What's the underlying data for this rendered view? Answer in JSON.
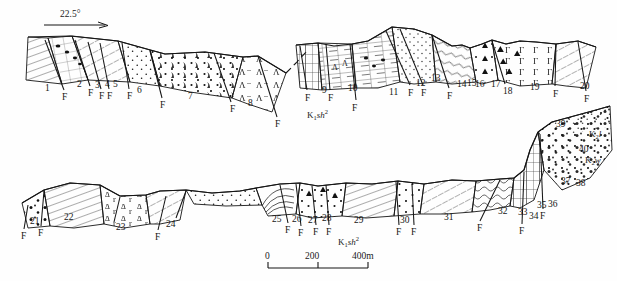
{
  "figure": {
    "type": "geological-cross-section",
    "background_color": "#fefefe",
    "ink_color": "#151515"
  },
  "dip_indicator": {
    "label": "22.5°",
    "name": "dip-angle-22-5"
  },
  "scale_bar": {
    "ticks": [
      "0",
      "200",
      "400m"
    ],
    "unit": "m"
  },
  "formation_labels": [
    {
      "id": "fm-upper",
      "text": "K1sh2",
      "base": "K",
      "sub": "1",
      "italic": "sh",
      "sup": "2"
    },
    {
      "id": "fm-lower",
      "text": "K1sh2",
      "base": "K",
      "sub": "1",
      "italic": "sh",
      "sup": "2"
    },
    {
      "id": "fm-k2l",
      "text": "K2l",
      "base": "K",
      "sub": "2",
      "italic": "l",
      "sup": ""
    },
    {
      "id": "fm-k2w",
      "text": "K2w",
      "base": "K",
      "sub": "2",
      "italic": "w",
      "sup": ""
    }
  ],
  "upper_panel": {
    "name": "upper-cross-section",
    "unit_numbers": [
      {
        "n": "1",
        "x": 45,
        "y": 84
      },
      {
        "n": "2",
        "x": 77,
        "y": 80
      },
      {
        "n": "3",
        "x": 95,
        "y": 81
      },
      {
        "n": "4",
        "x": 105,
        "y": 80
      },
      {
        "n": "5",
        "x": 113,
        "y": 80
      },
      {
        "n": "6",
        "x": 137,
        "y": 86
      },
      {
        "n": "7",
        "x": 188,
        "y": 92
      },
      {
        "n": "8",
        "x": 248,
        "y": 99
      },
      {
        "n": "9",
        "x": 322,
        "y": 86
      },
      {
        "n": "10",
        "x": 348,
        "y": 84
      },
      {
        "n": "11",
        "x": 389,
        "y": 88
      },
      {
        "n": "12",
        "x": 416,
        "y": 79
      },
      {
        "n": "13",
        "x": 431,
        "y": 74
      },
      {
        "n": "14",
        "x": 457,
        "y": 80
      },
      {
        "n": "15",
        "x": 467,
        "y": 79
      },
      {
        "n": "16",
        "x": 475,
        "y": 80
      },
      {
        "n": "17",
        "x": 491,
        "y": 80
      },
      {
        "n": "18",
        "x": 503,
        "y": 87
      },
      {
        "n": "19",
        "x": 530,
        "y": 83
      },
      {
        "n": "20",
        "x": 580,
        "y": 82
      }
    ],
    "fault_labels": [
      {
        "t": "F",
        "x": 62,
        "y": 93
      },
      {
        "t": "F",
        "x": 88,
        "y": 89
      },
      {
        "t": "F",
        "x": 99,
        "y": 92
      },
      {
        "t": "F",
        "x": 107,
        "y": 92
      },
      {
        "t": "F",
        "x": 127,
        "y": 92
      },
      {
        "t": "F",
        "x": 160,
        "y": 101
      },
      {
        "t": "F",
        "x": 230,
        "y": 105
      },
      {
        "t": "F",
        "x": 275,
        "y": 120
      },
      {
        "t": "F",
        "x": 305,
        "y": 94
      },
      {
        "t": "F",
        "x": 328,
        "y": 94
      },
      {
        "t": "F",
        "x": 352,
        "y": 104
      },
      {
        "t": "F",
        "x": 408,
        "y": 89
      },
      {
        "t": "F",
        "x": 421,
        "y": 89
      },
      {
        "t": "F",
        "x": 447,
        "y": 92
      },
      {
        "t": "F",
        "x": 553,
        "y": 90
      },
      {
        "t": "F",
        "x": 584,
        "y": 95
      }
    ]
  },
  "lower_panel": {
    "name": "lower-cross-section",
    "unit_numbers": [
      {
        "n": "21",
        "x": 30,
        "y": 217
      },
      {
        "n": "22",
        "x": 64,
        "y": 213
      },
      {
        "n": "23",
        "x": 116,
        "y": 223
      },
      {
        "n": "24",
        "x": 166,
        "y": 220
      },
      {
        "n": "25",
        "x": 272,
        "y": 215
      },
      {
        "n": "26",
        "x": 292,
        "y": 215
      },
      {
        "n": "27",
        "x": 308,
        "y": 216
      },
      {
        "n": "28",
        "x": 322,
        "y": 214
      },
      {
        "n": "29",
        "x": 354,
        "y": 216
      },
      {
        "n": "30",
        "x": 400,
        "y": 216
      },
      {
        "n": "31",
        "x": 444,
        "y": 213
      },
      {
        "n": "32",
        "x": 498,
        "y": 207
      },
      {
        "n": "33",
        "x": 518,
        "y": 208
      },
      {
        "n": "34",
        "x": 529,
        "y": 212
      },
      {
        "n": "35",
        "x": 537,
        "y": 201
      },
      {
        "n": "36",
        "x": 548,
        "y": 200
      },
      {
        "n": "37",
        "x": 561,
        "y": 177
      },
      {
        "n": "38",
        "x": 576,
        "y": 179
      },
      {
        "n": "39",
        "x": 556,
        "y": 120
      },
      {
        "n": "40",
        "x": 579,
        "y": 145
      }
    ],
    "fault_labels": [
      {
        "t": "F",
        "x": 21,
        "y": 232
      },
      {
        "t": "F",
        "x": 38,
        "y": 229
      },
      {
        "t": "F",
        "x": 155,
        "y": 233
      },
      {
        "t": "F",
        "x": 285,
        "y": 226
      },
      {
        "t": "F",
        "x": 298,
        "y": 229
      },
      {
        "t": "F",
        "x": 313,
        "y": 228
      },
      {
        "t": "F",
        "x": 326,
        "y": 228
      },
      {
        "t": "F",
        "x": 396,
        "y": 228
      },
      {
        "t": "F",
        "x": 411,
        "y": 228
      },
      {
        "t": "F",
        "x": 477,
        "y": 224
      },
      {
        "t": "F",
        "x": 519,
        "y": 227
      },
      {
        "t": "F",
        "x": 540,
        "y": 212
      }
    ]
  }
}
